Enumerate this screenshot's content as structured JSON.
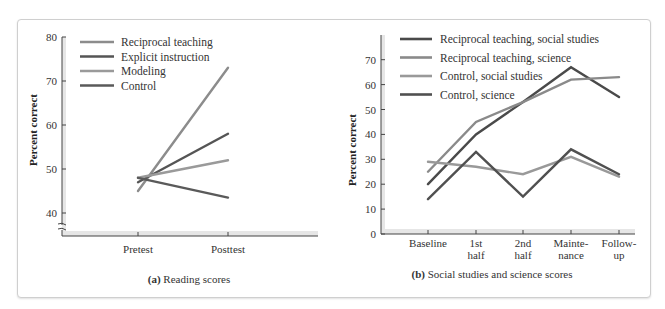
{
  "chart_data": [
    {
      "type": "line",
      "panel": "a",
      "title": "(a) Reading scores",
      "caption_prefix": "(a)",
      "caption_text": "Reading scores",
      "xlabel": "",
      "ylabel": "Percent correct",
      "categories": [
        "Pretest",
        "Posttest"
      ],
      "yticks": [
        40,
        50,
        60,
        70,
        80
      ],
      "ylim": [
        40,
        80
      ],
      "axis_break": true,
      "grid": false,
      "legend_position": "top-left inside",
      "series": [
        {
          "name": "Reciprocal teaching",
          "values": [
            45,
            73
          ],
          "color": "#8c8c8c"
        },
        {
          "name": "Explicit instruction",
          "values": [
            47,
            58
          ],
          "color": "#555555"
        },
        {
          "name": "Modeling",
          "values": [
            48,
            52
          ],
          "color": "#9a9a9a"
        },
        {
          "name": "Control",
          "values": [
            48,
            43.5
          ],
          "color": "#5a5a5a"
        }
      ]
    },
    {
      "type": "line",
      "panel": "b",
      "title": "(b) Social studies and science scores",
      "caption_prefix": "(b)",
      "caption_text": "Social studies and science scores",
      "xlabel": "",
      "ylabel": "Percent correct",
      "categories": [
        "Baseline",
        "1st half",
        "2nd half",
        "Maintenance",
        "Follow-up"
      ],
      "category_lines": [
        [
          "Baseline"
        ],
        [
          "1st",
          "half"
        ],
        [
          "2nd",
          "half"
        ],
        [
          "Mainte-",
          "nance"
        ],
        [
          "Follow-",
          "up"
        ]
      ],
      "yticks": [
        0,
        10,
        20,
        30,
        40,
        50,
        60,
        70
      ],
      "ylim": [
        0,
        75
      ],
      "grid": false,
      "legend_position": "top-left inside",
      "series": [
        {
          "name": "Reciprocal teaching, social studies",
          "values": [
            20,
            40,
            53,
            67,
            55
          ],
          "color": "#4a4a4a"
        },
        {
          "name": "Reciprocal teaching, science",
          "values": [
            25,
            45,
            53,
            62,
            63
          ],
          "color": "#8a8a8a"
        },
        {
          "name": "Control, social studies",
          "values": [
            29,
            27,
            24,
            31,
            23
          ],
          "color": "#999999"
        },
        {
          "name": "Control, science",
          "values": [
            14,
            33,
            15,
            34,
            24
          ],
          "color": "#505050"
        }
      ]
    }
  ]
}
